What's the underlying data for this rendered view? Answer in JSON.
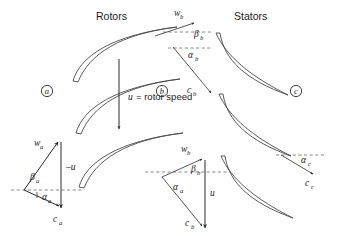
{
  "figure": {
    "width": 339,
    "height": 236,
    "background_color": "#ffffff",
    "line_color": "#3a3a3a",
    "text_color": "#1c1c1c",
    "dashed_color": "#6d6d6d"
  },
  "headers": {
    "rotors": "Rotors",
    "stators": "Stators"
  },
  "station_markers": [
    {
      "id": "a",
      "letter": "a",
      "x": 47,
      "y": 91
    },
    {
      "id": "b",
      "letter": "b",
      "x": 162,
      "y": 91
    },
    {
      "id": "c",
      "letter": "c",
      "x": 296,
      "y": 91
    }
  ],
  "annotations": {
    "rotor_speed_note": "= rotor speed",
    "rotor_speed_symbol": "u",
    "equals_sign": "="
  },
  "labels": {
    "w_a": {
      "sym": "w",
      "sub": "a"
    },
    "w_b_top": {
      "sym": "w",
      "sub": "b"
    },
    "w_b_bottom": {
      "sym": "w",
      "sub": "b"
    },
    "c_a": {
      "sym": "c",
      "sub": "a"
    },
    "c_b_top": {
      "sym": "c",
      "sub": "b"
    },
    "c_b_bottom": {
      "sym": "c",
      "sub": "b"
    },
    "c_c": {
      "sym": "c",
      "sub": "c"
    },
    "beta_a": {
      "sym": "β",
      "sub": "a"
    },
    "beta_b_top": {
      "sym": "β",
      "sub": "b"
    },
    "beta_b_bottom": {
      "sym": "β",
      "sub": "b"
    },
    "alpha_a_left": {
      "sym": "α",
      "sub": "a"
    },
    "alpha_a_mid": {
      "sym": "α",
      "sub": "a"
    },
    "alpha_b_top": {
      "sym": "α",
      "sub": "b"
    },
    "alpha_c": {
      "sym": "α",
      "sub": "c"
    },
    "minus_u_left": {
      "sym": "–u",
      "sub": ""
    },
    "u_mid": {
      "sym": "u",
      "sub": ""
    }
  },
  "blades": {
    "rotor_count": 3,
    "stator_count": 3,
    "rotor_label": "rotor-blade",
    "stator_label": "stator-blade"
  },
  "velocity_triangles": [
    {
      "id": "triangle-a",
      "station": "a",
      "vectors": [
        "w_a",
        "-u",
        "c_a"
      ],
      "angles": [
        "beta_a",
        "alpha_a"
      ],
      "description": "Rotor inlet velocity triangle at station a"
    },
    {
      "id": "triangle-b-top",
      "station": "b",
      "vectors": [
        "w_b",
        "c_b"
      ],
      "angles": [
        "beta_b",
        "alpha_b"
      ],
      "description": "Rotor exit / stator inlet flow angles at station b"
    },
    {
      "id": "triangle-b-bottom",
      "station": "b",
      "vectors": [
        "w_b",
        "u",
        "c_b"
      ],
      "angles": [
        "beta_b",
        "alpha_a"
      ],
      "description": "Rotor exit velocity triangle at station b"
    },
    {
      "id": "triangle-c",
      "station": "c",
      "vectors": [
        "c_c"
      ],
      "angles": [
        "alpha_c"
      ],
      "description": "Stator exit flow angle at station c"
    }
  ]
}
